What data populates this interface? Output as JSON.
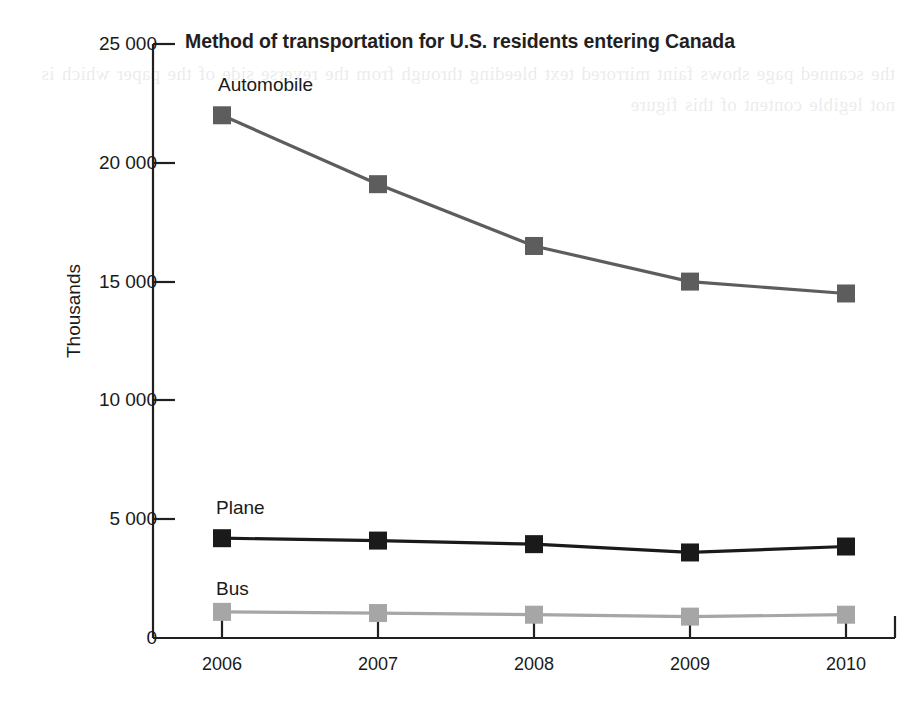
{
  "chart_data": {
    "type": "line",
    "title": "Method of transportation for U.S. residents entering Canada",
    "xlabel": "",
    "ylabel": "Thousands",
    "categories": [
      "2006",
      "2007",
      "2008",
      "2009",
      "2010"
    ],
    "x_tick_labels": [
      "2006",
      "2007",
      "2008",
      "2009",
      "2010"
    ],
    "y_tick_labels": [
      "0",
      "5 000",
      "10 000",
      "15 000",
      "20 000",
      "25 000"
    ],
    "y_tick_values": [
      0,
      5000,
      10000,
      15000,
      20000,
      25000
    ],
    "ylim": [
      0,
      25000
    ],
    "grid": false,
    "legend_position": "inline-labels",
    "markers": "square",
    "series": [
      {
        "name": "Automobile",
        "label": "Automobile",
        "color": "#5d5d5d",
        "values": [
          22000,
          19100,
          16500,
          15000,
          14500
        ]
      },
      {
        "name": "Plane",
        "label": "Plane",
        "color": "#1a1a1a",
        "values": [
          4200,
          4100,
          3950,
          3600,
          3850
        ]
      },
      {
        "name": "Bus",
        "label": "Bus",
        "color": "#a6a6a6",
        "values": [
          1100,
          1050,
          980,
          900,
          980
        ]
      }
    ]
  },
  "colors": {
    "automobile": "#5d5d5d",
    "plane": "#1a1a1a",
    "bus": "#a6a6a6",
    "axis": "#231f20",
    "text": "#1a1a1a"
  },
  "background_bleed_text": "the scanned page shows faint mirrored text bleeding through from the reverse side of the paper which is not legible content of this figure"
}
